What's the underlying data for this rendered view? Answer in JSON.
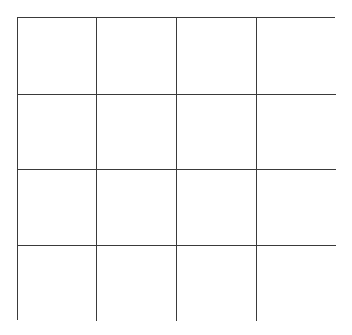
{
  "diagram": {
    "type": "grid",
    "rows": 4,
    "columns": 4,
    "line_color": "#3a3a3a",
    "background_color": "#ffffff",
    "cells": [
      [
        "",
        "",
        "",
        ""
      ],
      [
        "",
        "",
        "",
        ""
      ],
      [
        "",
        "",
        "",
        ""
      ],
      [
        "",
        "",
        "",
        ""
      ]
    ]
  }
}
